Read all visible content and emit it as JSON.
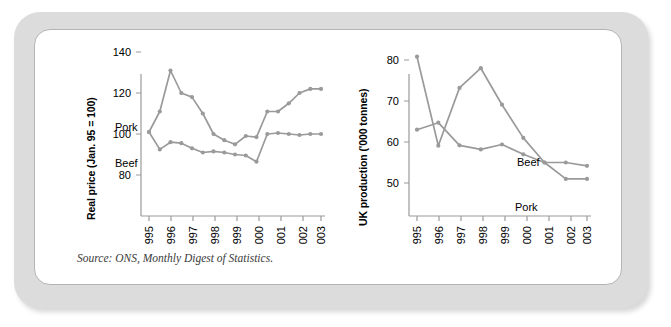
{
  "figure": {
    "source_note": "Source: ONS, Monthly Digest of Statistics.",
    "frame_color": "#dcdcdc",
    "panel_color": "#ffffff",
    "series_color": "#9a9a9a"
  },
  "chart_data": [
    {
      "type": "line",
      "title": "",
      "xlabel": "",
      "ylabel": "Real price (Jan. 95 = 100)",
      "x": [
        1995,
        1995.5,
        1996,
        1996.5,
        1997,
        1997.5,
        1998,
        1998.5,
        1999,
        1999.5,
        2000,
        2000.5,
        2001,
        2001.5,
        2002,
        2002.5,
        2003
      ],
      "xticks": [
        "1995",
        "1996",
        "1997",
        "1998",
        "1999",
        "2000",
        "2001",
        "2002",
        "2003"
      ],
      "yticks": [
        80,
        100,
        120,
        140
      ],
      "ylim": [
        70,
        145
      ],
      "grid": false,
      "legend_position": "inline-labels",
      "series": [
        {
          "name": "Pork",
          "values": [
            101,
            111,
            131,
            120,
            118,
            110,
            100,
            97,
            95,
            99,
            98.5,
            111,
            111,
            115,
            120,
            122,
            122
          ]
        },
        {
          "name": "Beef",
          "values": [
            101,
            92.5,
            96,
            95.5,
            93,
            91,
            91.5,
            91,
            90,
            89.5,
            86.5,
            100,
            100.5,
            100,
            99.5,
            100,
            100
          ]
        }
      ]
    },
    {
      "type": "line",
      "title": "",
      "xlabel": "",
      "ylabel": "UK production ('000 tonnes)",
      "x": [
        1995,
        1996,
        1997,
        1998,
        1999,
        2000,
        2001,
        2002,
        2003
      ],
      "xticks": [
        "1995",
        "1996",
        "1997",
        "1998",
        "1999",
        "2000",
        "2001",
        "2002",
        "2003"
      ],
      "yticks": [
        50,
        60,
        70,
        80
      ],
      "ylim": [
        44,
        84
      ],
      "grid": false,
      "legend_position": "inline-labels",
      "series": [
        {
          "name": "Beef",
          "values": [
            63,
            64.7,
            59.2,
            58.2,
            59.4,
            57,
            55,
            55,
            54.2,
            58
          ]
        },
        {
          "name": "Pork",
          "values": [
            80.8,
            59.1,
            73.2,
            78,
            69.1,
            61,
            55,
            51,
            51,
            53.2
          ]
        }
      ]
    }
  ],
  "charts": {
    "left": {
      "y_axis_title": "Real price (Jan. 95 = 100)",
      "y_tick_labels": [
        "140",
        "120",
        "100",
        "80"
      ],
      "x_tick_labels": [
        "1995",
        "1996",
        "1997",
        "1998",
        "1999",
        "2000",
        "2001",
        "2002",
        "2003"
      ],
      "series_label_upper": "Pork",
      "series_label_lower": "Beef"
    },
    "right": {
      "y_axis_title": "UK production ('000 tonnes)",
      "y_tick_labels": [
        "80",
        "70",
        "60",
        "50"
      ],
      "x_tick_labels": [
        "1995",
        "1996",
        "1997",
        "1998",
        "1999",
        "2000",
        "2001",
        "2002",
        "2003"
      ],
      "series_label_upper": "Beef",
      "series_label_lower": "Pork"
    }
  }
}
